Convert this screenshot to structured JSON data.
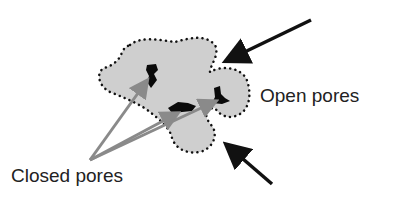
{
  "diagram": {
    "labels": {
      "open_pores": "Open pores",
      "closed_pores": "Closed pores"
    },
    "colors": {
      "particle_fill": "#cfcfcf",
      "particle_outline": "#111111",
      "closed_pore": "#0a0a0a",
      "open_arrow": "#111111",
      "closed_arrow": "#8a8a8a"
    }
  }
}
